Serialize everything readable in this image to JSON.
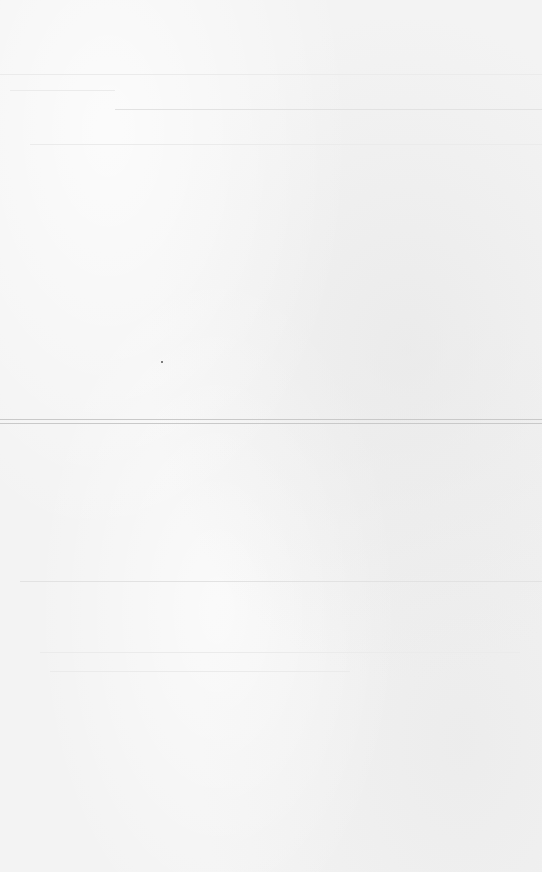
{
  "page": {
    "background": "#f3f3f3",
    "rules": [
      {
        "y": 74,
        "x": 0,
        "width": 542,
        "style": "faint"
      },
      {
        "y": 90,
        "x": 10,
        "width": 105,
        "style": "faint"
      },
      {
        "y": 109,
        "x": 115,
        "width": 427,
        "style": "normal"
      },
      {
        "y": 144,
        "x": 30,
        "width": 512,
        "style": "faint"
      },
      {
        "y": 419,
        "x": 0,
        "width": 542,
        "style": "strong"
      },
      {
        "y": 423,
        "x": 0,
        "width": 542,
        "style": "strong"
      },
      {
        "y": 581,
        "x": 20,
        "width": 522,
        "style": "normal"
      },
      {
        "y": 652,
        "x": 40,
        "width": 480,
        "style": "faint"
      },
      {
        "y": 671,
        "x": 50,
        "width": 300,
        "style": "faint"
      }
    ],
    "specks": [
      {
        "x": 161,
        "y": 361
      }
    ]
  }
}
